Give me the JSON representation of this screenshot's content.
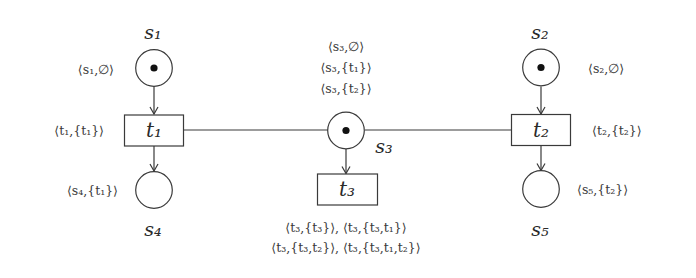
{
  "diagram": {
    "type": "petri-net",
    "places": [
      {
        "id": "s1",
        "name": "s₁",
        "marked": true,
        "annotation": "⟨s₁,∅⟩"
      },
      {
        "id": "s2",
        "name": "s₂",
        "marked": true,
        "annotation": "⟨s₂,∅⟩"
      },
      {
        "id": "s3",
        "name": "s₃",
        "marked": true,
        "annotations": [
          "⟨s₃,∅⟩",
          "⟨s₃,{t₁}⟩",
          "⟨s₃,{t₂}⟩"
        ]
      },
      {
        "id": "s4",
        "name": "s₄",
        "marked": false,
        "annotation": "⟨s₄,{t₁}⟩"
      },
      {
        "id": "s5",
        "name": "s₅",
        "marked": false,
        "annotation": "⟨s₅,{t₂}⟩"
      }
    ],
    "transitions": [
      {
        "id": "t1",
        "name": "t₁",
        "annotation": "⟨t₁,{t₁}⟩"
      },
      {
        "id": "t2",
        "name": "t₂",
        "annotation": "⟨t₂,{t₂}⟩"
      },
      {
        "id": "t3",
        "name": "t₃",
        "annotations": [
          "⟨t₃,{t₃}⟩,  ⟨t₃,{t₃,t₁}⟩",
          "⟨t₃,{t₃,t₂}⟩,  ⟨t₃,{t₃,t₁,t₂}⟩"
        ]
      }
    ],
    "arcs": [
      {
        "from": "s1",
        "to": "t1",
        "directed": true
      },
      {
        "from": "t1",
        "to": "s4",
        "directed": true
      },
      {
        "from": "s2",
        "to": "t2",
        "directed": true
      },
      {
        "from": "t2",
        "to": "s5",
        "directed": true
      },
      {
        "from": "s3",
        "to": "t3",
        "directed": true
      },
      {
        "from": "t1",
        "to": "s3",
        "directed": false
      },
      {
        "from": "s3",
        "to": "t2",
        "directed": false
      }
    ],
    "colors": {
      "stroke": "#3a3a3a",
      "token": "#111111",
      "background": "#ffffff"
    }
  }
}
